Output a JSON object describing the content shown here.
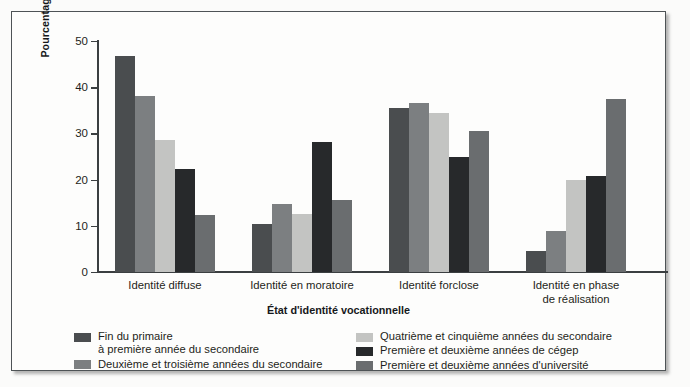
{
  "chart_data": {
    "type": "bar",
    "title": "",
    "subtitle": "",
    "xlabel": "État d'identité vocationnelle",
    "ylabel": "Pourcentage de jeunes\ndans chaque état par choix vocationnel",
    "ylim": [
      0,
      50
    ],
    "yticks": [
      0,
      10,
      20,
      30,
      40,
      50
    ],
    "ytick_labels": [
      "0",
      "10",
      "20",
      "30",
      "40",
      "50"
    ],
    "grid": false,
    "legend_position": "bottom",
    "categories": [
      "Identité diffuse",
      "Identité en moratoire",
      "Identité forclose",
      "Identité en phase\nde réalisation"
    ],
    "series": [
      {
        "name": "Fin du primaire\nà première année du secondaire",
        "color": "#4a4d4f",
        "values": [
          46.7,
          10.5,
          35.5,
          4.5
        ]
      },
      {
        "name": "Deuxième et troisième années du secondaire",
        "color": "#7c7f81",
        "values": [
          38.0,
          14.8,
          36.5,
          8.8
        ]
      },
      {
        "name": "Quatrième et cinquième années du secondaire",
        "color": "#c3c4c2",
        "values": [
          28.5,
          12.5,
          34.5,
          20.0
        ]
      },
      {
        "name": "Première et deuxième années de cégep",
        "color": "#27292b",
        "values": [
          22.4,
          28.2,
          25.0,
          20.8
        ]
      },
      {
        "name": "Première et deuxième années d'université",
        "color": "#6a6d6f",
        "values": [
          12.3,
          15.5,
          30.5,
          37.4
        ]
      }
    ]
  },
  "legend": {
    "left_column": [
      {
        "swatch_color": "#4a4d4f",
        "label": "Fin du primaire\nà première année du secondaire"
      },
      {
        "swatch_color": "#7c7f81",
        "label": "Deuxième et troisième années du secondaire"
      }
    ],
    "right_column": [
      {
        "swatch_color": "#c3c4c2",
        "label": "Quatrième et cinquième années du secondaire"
      },
      {
        "swatch_color": "#27292b",
        "label": "Première et deuxième années de cégep"
      },
      {
        "swatch_color": "#6a6d6f",
        "label": "Première et deuxième années d'université"
      }
    ]
  },
  "colors": {
    "frame_border": "#4e5356",
    "axis": "#3b3f41",
    "background": "#fdfdfc",
    "text": "#1d1f20"
  }
}
